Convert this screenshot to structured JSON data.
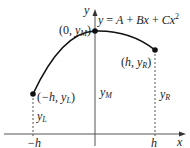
{
  "diagram": {
    "equation": {
      "lhs": "y",
      "rhs_parts": [
        "A",
        "Bx",
        "Cx"
      ],
      "exponent": "2",
      "text": "y = A + Bx + Cx^2"
    },
    "axes": {
      "x_label": "x",
      "y_label": "y"
    },
    "points": [
      {
        "id": "left",
        "label_x": "−h",
        "label_y": "y",
        "label_y_sub": "L",
        "text": "(−h, y_L)"
      },
      {
        "id": "middle",
        "label_x": "0",
        "label_y": "y",
        "label_y_sub": "M",
        "text": "(0, y_M)"
      },
      {
        "id": "right",
        "label_x": "h",
        "label_y": "y",
        "label_y_sub": "R",
        "text": "(h, y_R)"
      }
    ],
    "ordinates": [
      {
        "label": "y",
        "sub": "L"
      },
      {
        "label": "y",
        "sub": "M"
      },
      {
        "label": "y",
        "sub": "R"
      }
    ],
    "ticks": [
      {
        "label": "−h"
      },
      {
        "label": "h"
      }
    ],
    "colors": {
      "stroke": "#111111",
      "axis": "#555555",
      "text": "#222222"
    }
  }
}
